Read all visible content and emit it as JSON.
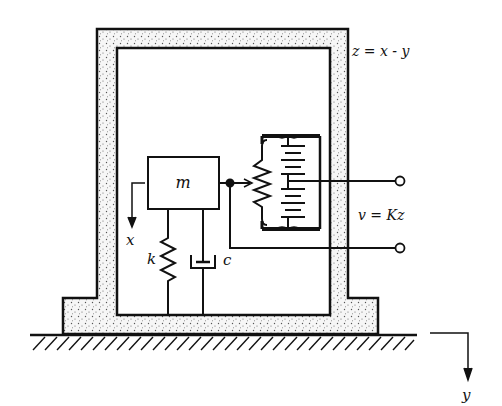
{
  "diagram": {
    "labels": {
      "mass": "m",
      "spring": "k",
      "damper": "c",
      "mass_displacement": "x",
      "ground_displacement": "y",
      "relative_eq": "z = x - y",
      "voltage_eq": "v = Kz"
    },
    "components": [
      {
        "id": "housing",
        "type": "stippled frame"
      },
      {
        "id": "mass",
        "type": "box",
        "label": "m"
      },
      {
        "id": "spring",
        "type": "spring",
        "label": "k"
      },
      {
        "id": "damper",
        "type": "dashpot",
        "label": "c"
      },
      {
        "id": "potentiometer",
        "type": "resistor with wiper"
      },
      {
        "id": "battery",
        "type": "battery stack"
      },
      {
        "id": "terminal-top",
        "type": "output terminal"
      },
      {
        "id": "terminal-bottom",
        "type": "output terminal"
      },
      {
        "id": "ground",
        "type": "hatched ground"
      }
    ],
    "colors": {
      "ink": "#111111",
      "stipple_bg": "#f4f4f4",
      "background": "#ffffff"
    }
  }
}
